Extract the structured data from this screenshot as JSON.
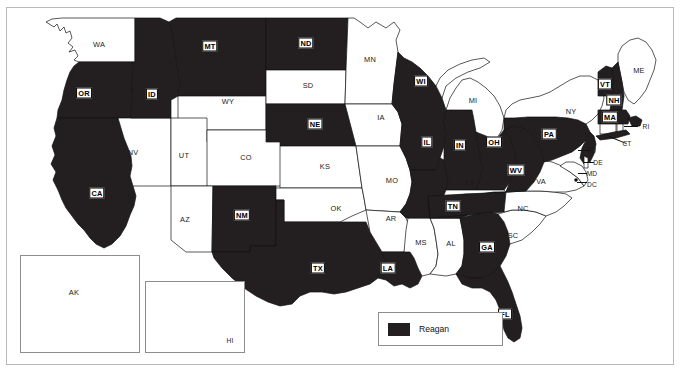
{
  "map": {
    "title": "United States presidential election results map",
    "colors": {
      "shaded": "#231f20",
      "unshaded": "#ffffff",
      "border": "#111111",
      "frame": "#b9b9b9"
    },
    "legend": {
      "label": "Reagan",
      "swatch_color": "#231f20"
    },
    "insets": [
      {
        "name": "alaska-inset",
        "label": "AK",
        "shaded": false
      },
      {
        "name": "hawaii-inset",
        "label": "HI",
        "shaded": false
      }
    ],
    "states": [
      {
        "code": "WA",
        "shaded": false,
        "x": 99,
        "y": 44
      },
      {
        "code": "OR",
        "shaded": true,
        "x": 84,
        "y": 93
      },
      {
        "code": "CA",
        "shaded": true,
        "x": 97,
        "y": 193
      },
      {
        "code": "NV",
        "shaded": false,
        "x": 133,
        "y": 152
      },
      {
        "code": "ID",
        "shaded": true,
        "x": 152,
        "y": 94
      },
      {
        "code": "MT",
        "shaded": true,
        "x": 210,
        "y": 46
      },
      {
        "code": "WY",
        "shaded": false,
        "x": 228,
        "y": 101
      },
      {
        "code": "UT",
        "shaded": false,
        "x": 184,
        "y": 155
      },
      {
        "code": "AZ",
        "shaded": false,
        "x": 185,
        "y": 219
      },
      {
        "code": "NM",
        "shaded": true,
        "x": 242,
        "y": 215
      },
      {
        "code": "CO",
        "shaded": false,
        "x": 246,
        "y": 157
      },
      {
        "code": "ND",
        "shaded": true,
        "x": 306,
        "y": 43
      },
      {
        "code": "SD",
        "shaded": false,
        "x": 308,
        "y": 85
      },
      {
        "code": "NE",
        "shaded": true,
        "x": 315,
        "y": 124
      },
      {
        "code": "KS",
        "shaded": false,
        "x": 325,
        "y": 166
      },
      {
        "code": "OK",
        "shaded": false,
        "x": 336,
        "y": 208
      },
      {
        "code": "TX",
        "shaded": true,
        "x": 318,
        "y": 268
      },
      {
        "code": "MN",
        "shaded": false,
        "x": 370,
        "y": 59
      },
      {
        "code": "IA",
        "shaded": false,
        "x": 381,
        "y": 117
      },
      {
        "code": "MO",
        "shaded": false,
        "x": 392,
        "y": 180
      },
      {
        "code": "AR",
        "shaded": false,
        "x": 391,
        "y": 218
      },
      {
        "code": "LA",
        "shaded": true,
        "x": 388,
        "y": 268
      },
      {
        "code": "MS",
        "shaded": false,
        "x": 421,
        "y": 242
      },
      {
        "code": "AL",
        "shaded": false,
        "x": 451,
        "y": 243
      },
      {
        "code": "WI",
        "shaded": true,
        "x": 421,
        "y": 81
      },
      {
        "code": "IL",
        "shaded": true,
        "x": 427,
        "y": 142
      },
      {
        "code": "IN",
        "shaded": true,
        "x": 460,
        "y": 145
      },
      {
        "code": "MI",
        "shaded": false,
        "x": 473,
        "y": 100
      },
      {
        "code": "OH",
        "shaded": true,
        "x": 494,
        "y": 142
      },
      {
        "code": "KY",
        "shaded": false,
        "x": 470,
        "y": 182
      },
      {
        "code": "TN",
        "shaded": true,
        "x": 453,
        "y": 206
      },
      {
        "code": "GA",
        "shaded": true,
        "x": 487,
        "y": 247
      },
      {
        "code": "FL",
        "shaded": true,
        "x": 505,
        "y": 314
      },
      {
        "code": "SC",
        "shaded": false,
        "x": 513,
        "y": 235
      },
      {
        "code": "NC",
        "shaded": false,
        "x": 523,
        "y": 208
      },
      {
        "code": "VA",
        "shaded": false,
        "x": 541,
        "y": 181
      },
      {
        "code": "WV",
        "shaded": true,
        "x": 516,
        "y": 170
      },
      {
        "code": "PA",
        "shaded": true,
        "x": 549,
        "y": 134
      },
      {
        "code": "NY",
        "shaded": false,
        "x": 571,
        "y": 111
      },
      {
        "code": "ME",
        "shaded": false,
        "x": 639,
        "y": 70
      },
      {
        "code": "VT",
        "shaded": true,
        "x": 605,
        "y": 84
      },
      {
        "code": "NH",
        "shaded": true,
        "x": 614,
        "y": 100
      },
      {
        "code": "MA",
        "shaded": true,
        "x": 610,
        "y": 117
      }
    ],
    "callout_labels": [
      {
        "code": "RI",
        "x": 646,
        "y": 126
      },
      {
        "code": "CT",
        "x": 627,
        "y": 143
      },
      {
        "code": "NJ",
        "x": 592,
        "y": 150
      },
      {
        "code": "DE",
        "x": 598,
        "y": 162
      },
      {
        "code": "MD",
        "x": 592,
        "y": 173
      },
      {
        "code": "DC",
        "x": 592,
        "y": 184
      }
    ]
  }
}
